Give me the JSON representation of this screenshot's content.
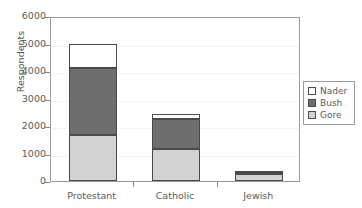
{
  "chart_data": {
    "type": "bar",
    "subtype": "stacked",
    "title": "",
    "xlabel": "",
    "ylabel": "Respondents",
    "categories": [
      "Protestant",
      "Catholic",
      "Jewish"
    ],
    "series": [
      {
        "name": "Gore",
        "color": "#d2d2d2",
        "values": [
          1670,
          1150,
          240
        ]
      },
      {
        "name": "Bush",
        "color": "#6e6e6e",
        "values": [
          2430,
          1100,
          100
        ]
      },
      {
        "name": "Nader",
        "color": "#ffffff",
        "values": [
          870,
          180,
          20
        ]
      }
    ],
    "totals": [
      4970,
      2430,
      360
    ],
    "ylim": [
      0,
      6000
    ],
    "yticks": [
      0,
      1000,
      2000,
      3000,
      4000,
      5000,
      6000
    ],
    "ytick_labels": [
      "0",
      "1000",
      "2000",
      "3000",
      "4000",
      "5000",
      "6000"
    ],
    "grid": true,
    "legend_position": "right",
    "legend_entries": [
      "Nader",
      "Bush",
      "Gore"
    ]
  },
  "legend": {
    "items": [
      {
        "label": "Nader",
        "color": "#ffffff"
      },
      {
        "label": "Bush",
        "color": "#6e6e6e"
      },
      {
        "label": "Gore",
        "color": "#d2d2d2"
      }
    ]
  }
}
